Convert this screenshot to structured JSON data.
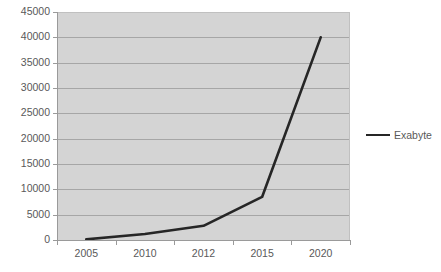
{
  "chart_data": {
    "type": "line",
    "title": "",
    "xlabel": "",
    "ylabel": "",
    "categories": [
      "2005",
      "2010",
      "2012",
      "2015",
      "2020"
    ],
    "series": [
      {
        "name": "Exabyte",
        "values": [
          130,
          1200,
          2800,
          8500,
          40000
        ],
        "color": "#262626"
      }
    ],
    "ylim": [
      0,
      45000
    ],
    "ytick_labels": [
      "0",
      "5000",
      "10000",
      "15000",
      "20000",
      "25000",
      "30000",
      "35000",
      "40000",
      "45000"
    ],
    "ytick_values": [
      0,
      5000,
      10000,
      15000,
      20000,
      25000,
      30000,
      35000,
      40000,
      45000
    ],
    "grid": true,
    "grid_axis": "y",
    "legend": {
      "position": "right",
      "entries": [
        {
          "label": "Exabyte",
          "marker": "line-swatch",
          "color": "#262626"
        }
      ]
    },
    "colors": {
      "plot_background": "#d4d4d4",
      "page_background": "#ffffff",
      "gridline": "#a6a6a6",
      "axis": "#9a9a9a",
      "tick_label": "#595959",
      "series_line": "#262626"
    }
  }
}
